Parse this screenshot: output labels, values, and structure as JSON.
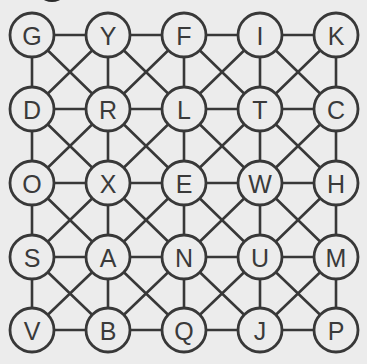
{
  "puzzle": {
    "type": "letter-grid-path",
    "rows": 5,
    "cols": 5,
    "connectivity": "king-moves (horizontal, vertical, both diagonals in every cell)",
    "grid": [
      [
        "G",
        "Y",
        "F",
        "I",
        "K"
      ],
      [
        "D",
        "R",
        "L",
        "T",
        "C"
      ],
      [
        "O",
        "X",
        "E",
        "W",
        "H"
      ],
      [
        "S",
        "A",
        "N",
        "U",
        "M"
      ],
      [
        "V",
        "B",
        "Q",
        "J",
        "P"
      ]
    ],
    "colors": {
      "background": "#ececec",
      "line": "#383838",
      "letter": "#3a3a3a"
    }
  }
}
